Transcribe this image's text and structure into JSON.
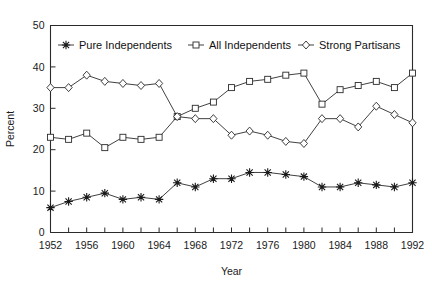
{
  "chart_data": {
    "type": "line",
    "title": "",
    "xlabel": "Year",
    "ylabel": "Percent",
    "xlim": [
      1952,
      1992
    ],
    "ylim": [
      0,
      50
    ],
    "grid": false,
    "legend_position": "top-inside",
    "x": [
      1952,
      1954,
      1956,
      1958,
      1960,
      1962,
      1964,
      1966,
      1968,
      1970,
      1972,
      1974,
      1976,
      1978,
      1980,
      1982,
      1984,
      1986,
      1988,
      1990,
      1992
    ],
    "xtick_labels": [
      "1952",
      "1956",
      "1960",
      "1964",
      "1968",
      "1972",
      "1976",
      "1980",
      "1984",
      "1988",
      "1992"
    ],
    "xtick_values": [
      1952,
      1956,
      1960,
      1964,
      1968,
      1972,
      1976,
      1980,
      1984,
      1988,
      1992
    ],
    "xtick_minor_values": [
      1954,
      1958,
      1962,
      1966,
      1970,
      1974,
      1978,
      1982,
      1986,
      1990
    ],
    "ytick_labels": [
      "0",
      "10",
      "20",
      "30",
      "40",
      "50"
    ],
    "ytick_values": [
      0,
      10,
      20,
      30,
      40,
      50
    ],
    "series": [
      {
        "name": "Pure Independents",
        "marker": "star",
        "values": [
          6.0,
          7.5,
          8.5,
          9.5,
          8.0,
          8.5,
          8.0,
          12.0,
          11.0,
          13.0,
          13.0,
          14.5,
          14.5,
          14.0,
          13.5,
          11.0,
          11.0,
          12.0,
          11.5,
          11.0,
          12.0
        ]
      },
      {
        "name": "All Independents",
        "marker": "square",
        "values": [
          23.0,
          22.5,
          24.0,
          20.5,
          23.0,
          22.5,
          23.0,
          28.0,
          30.0,
          31.5,
          35.0,
          36.5,
          37.0,
          38.0,
          38.5,
          31.0,
          34.5,
          35.5,
          36.5,
          35.0,
          38.5
        ]
      },
      {
        "name": "Strong Partisans",
        "marker": "diamond",
        "values": [
          35.0,
          35.0,
          38.0,
          36.5,
          36.0,
          35.5,
          36.0,
          28.0,
          27.5,
          27.5,
          23.5,
          24.5,
          23.5,
          22.0,
          21.5,
          27.5,
          27.5,
          25.5,
          30.5,
          28.5,
          26.5
        ]
      }
    ]
  },
  "legend": {
    "items": [
      {
        "label": "Pure Independents",
        "marker": "star"
      },
      {
        "label": "All Independents",
        "marker": "square"
      },
      {
        "label": "Strong Partisans",
        "marker": "diamond"
      }
    ]
  },
  "colors": {
    "axis": "#2b2b2b",
    "ink": "#1a1a1a",
    "background": "#ffffff",
    "marker_fill": "#ffffff"
  }
}
